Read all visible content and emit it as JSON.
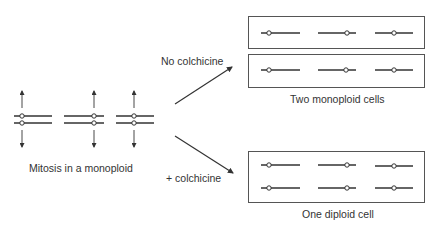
{
  "labels": {
    "mitosis": "Mitosis in a monoploid",
    "no_colchicine": "No colchicine",
    "plus_colchicine": "+ colchicine",
    "two_monoploid": "Two monoploid cells",
    "one_diploid": "One diploid cell"
  },
  "colors": {
    "line": "#333333",
    "box": "#555555",
    "text": "#333333"
  },
  "left_chromosomes": [
    {
      "x1": 14,
      "x2": 52,
      "centromere": 22
    },
    {
      "x1": 64,
      "x2": 104,
      "centromere": 95
    },
    {
      "x1": 116,
      "x2": 154,
      "centromere": 135
    }
  ],
  "cell_chromosomes": [
    {
      "x1": 261,
      "x2": 300,
      "centromere": 269
    },
    {
      "x1": 318,
      "x2": 356,
      "centromere": 347
    },
    {
      "x1": 375,
      "x2": 413,
      "centromere": 394
    }
  ]
}
